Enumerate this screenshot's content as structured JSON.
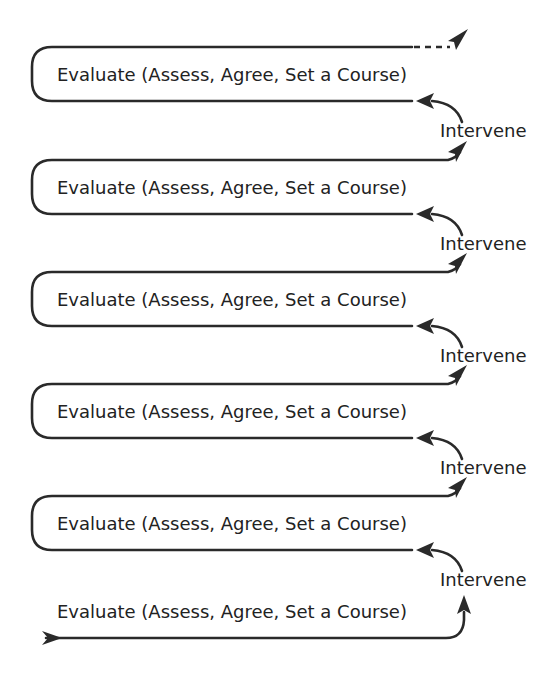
{
  "diagram": {
    "loops": [
      {
        "label": "Evaluate (Assess, Agree, Set a Course)",
        "exit": "dashed"
      },
      {
        "label": "Evaluate (Assess, Agree, Set a Course)",
        "exit": "solid"
      },
      {
        "label": "Evaluate (Assess, Agree, Set a Course)",
        "exit": "solid"
      },
      {
        "label": "Evaluate (Assess, Agree, Set a Course)",
        "exit": "solid"
      },
      {
        "label": "Evaluate (Assess, Agree, Set a Course)",
        "exit": "solid"
      }
    ],
    "start": {
      "label": "Evaluate (Assess, Agree, Set a Course)"
    },
    "intervene_labels": [
      "Intervene",
      "Intervene",
      "Intervene",
      "Intervene",
      "Intervene"
    ],
    "colors": {
      "line": "#2a2a2a",
      "text": "#222222",
      "background": "#ffffff"
    }
  }
}
